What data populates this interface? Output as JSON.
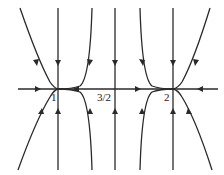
{
  "diagram": {
    "type": "phase-portrait",
    "axis": {
      "orientation": "horizontal",
      "color": "#2a2a2a"
    },
    "fixed_points": [
      {
        "label": "1",
        "x_px": 58
      },
      {
        "label": "3/2",
        "x_px": 115
      },
      {
        "label": "2",
        "x_px": 173
      }
    ],
    "labels": {
      "point_1": "1",
      "point_3_2": "3/2",
      "point_2": "2"
    },
    "axis_flow": [
      {
        "segment": "left of 1",
        "direction": "right"
      },
      {
        "segment": "between 1 and 3/2",
        "direction": "left"
      },
      {
        "segment": "between 3/2 and 2",
        "direction": "right"
      },
      {
        "segment": "right of 2",
        "direction": "left"
      }
    ],
    "vertical_flow": "trajectories flow toward the axis from above (down) and below (up)"
  }
}
